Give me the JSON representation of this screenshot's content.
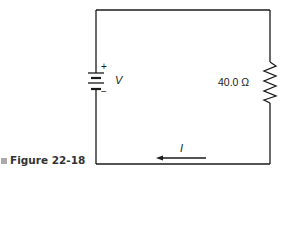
{
  "figure": {
    "caption_label": "Figure 22-18",
    "battery_label": "V",
    "battery_plus": "+",
    "battery_minus": "−",
    "resistor_label": "40.0 Ω",
    "current_label": "I",
    "current_direction": "left"
  },
  "colors": {
    "line": "#1a1a1a",
    "caption_marker": "#aaaaaa",
    "background": "#ffffff"
  }
}
